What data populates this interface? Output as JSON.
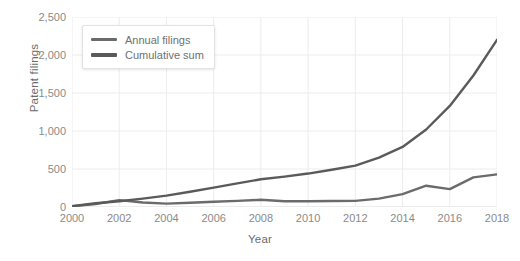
{
  "chart_data": {
    "type": "line",
    "title": "",
    "xlabel": "Year",
    "ylabel": "Patent filings",
    "xlim": [
      2000,
      2018
    ],
    "ylim": [
      0,
      2500
    ],
    "grid": true,
    "legend_position": "top-left",
    "x": [
      2000,
      2001,
      2002,
      2003,
      2004,
      2005,
      2006,
      2007,
      2008,
      2009,
      2010,
      2011,
      2012,
      2013,
      2014,
      2015,
      2016,
      2017,
      2018
    ],
    "x_tick_labels": [
      "2000",
      "2002",
      "2004",
      "2006",
      "2008",
      "2010",
      "2012",
      "2014",
      "2016",
      "2018"
    ],
    "x_ticks": [
      2000,
      2002,
      2004,
      2006,
      2008,
      2010,
      2012,
      2014,
      2016,
      2018
    ],
    "y_tick_labels": [
      "0",
      "500",
      "1,000",
      "1,500",
      "2,000",
      "2,500"
    ],
    "y_ticks": [
      0,
      500,
      1000,
      1500,
      2000,
      2500
    ],
    "series": [
      {
        "name": "Annual filings",
        "color": "#6b6b6b",
        "values": [
          10,
          40,
          90,
          60,
          45,
          55,
          70,
          80,
          95,
          75,
          75,
          78,
          80,
          110,
          170,
          280,
          235,
          390,
          430
        ]
      },
      {
        "name": "Cumulative sum",
        "color": "#5a5a5a",
        "values": [
          10,
          50,
          75,
          110,
          150,
          200,
          255,
          310,
          365,
          400,
          440,
          490,
          545,
          650,
          790,
          1020,
          1330,
          1730,
          2200
        ]
      }
    ]
  },
  "legend": {
    "items": [
      {
        "label": "Annual filings"
      },
      {
        "label": "Cumulative sum"
      }
    ]
  },
  "axes": {
    "y_title": "Patent filings",
    "x_title": "Year"
  }
}
